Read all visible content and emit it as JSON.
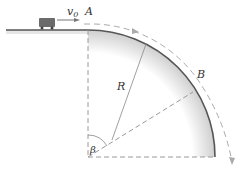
{
  "diagram": {
    "labels": {
      "velocity": "v",
      "velocity_sub": "0",
      "point_a": "A",
      "point_b": "B",
      "radius": "R",
      "angle": "β"
    },
    "colors": {
      "surface": "#555555",
      "dash": "#9a9a9a",
      "car": "#6b6b6b",
      "shade": "#d8d8d8"
    }
  }
}
